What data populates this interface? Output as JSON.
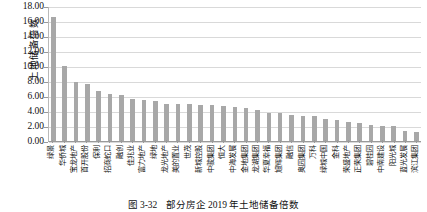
{
  "figure": {
    "caption_number": "图 3-32",
    "caption_text": "部分房企 2019 年土地储备倍数"
  },
  "chart_data": {
    "type": "bar",
    "title": "",
    "xlabel": "",
    "ylabel": "土地储备倍数",
    "ylim": [
      0,
      18
    ],
    "ytick_labels": [
      "18.00",
      "16.00",
      "14.00",
      "12.00",
      "10.00",
      "8.00",
      "6.00",
      "4.00",
      "2.00",
      "0.00"
    ],
    "ytick_values": [
      18,
      16,
      14,
      12,
      10,
      8,
      6,
      4,
      2,
      0
    ],
    "grid": true,
    "legend": "none",
    "bar_color": "#a8a8a8",
    "categories": [
      "绿景",
      "华侨城",
      "宝龙地产",
      "首开股份",
      "保利",
      "招商蛇口",
      "融创",
      "佳兆业",
      "富力地产",
      "绿地",
      "龙光地产",
      "美的置业",
      "世茂",
      "新城控股",
      "中骏集团",
      "恒大",
      "中海发展",
      "金地集团",
      "龙湖集团",
      "华夏幸福",
      "旭辉集团",
      "融信",
      "奥园集团",
      "万科",
      "绿城中国",
      "金科",
      "荣盛地产",
      "正荣集团",
      "碧桂园",
      "中南建设",
      "阳光城",
      "蓝光发展",
      "滨江集团"
    ],
    "values": [
      16.55,
      9.95,
      7.85,
      7.55,
      6.65,
      6.25,
      6.1,
      5.6,
      5.45,
      5.3,
      5.0,
      4.95,
      4.95,
      4.8,
      4.75,
      4.7,
      4.55,
      4.4,
      4.15,
      3.8,
      3.75,
      3.5,
      3.35,
      3.3,
      3.0,
      2.85,
      2.55,
      2.4,
      2.2,
      2.05,
      2.05,
      1.4,
      1.25
    ]
  }
}
